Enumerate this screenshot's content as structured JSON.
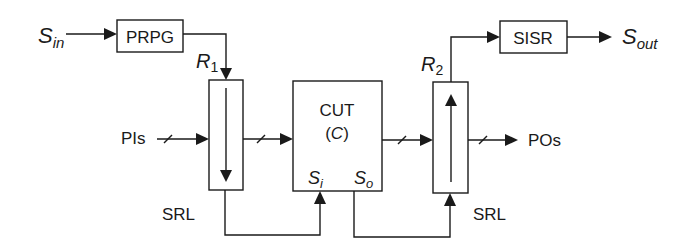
{
  "diagram": {
    "inputs": {
      "scan_in": {
        "main": "S",
        "sub": "in"
      },
      "primary_inputs": "PIs"
    },
    "outputs": {
      "scan_out": {
        "main": "S",
        "sub": "out"
      },
      "primary_outputs": "POs"
    },
    "blocks": {
      "prpg": "PRPG",
      "sisr": "SISR",
      "cut": {
        "line1": "CUT",
        "line2_open": "(",
        "line2_var": "C",
        "line2_close": ")"
      },
      "cut_scan_in": {
        "main": "S",
        "sub": "i"
      },
      "cut_scan_out": {
        "main": "S",
        "sub": "o"
      }
    },
    "registers": {
      "r1": {
        "main": "R",
        "sub": "1",
        "label": "SRL"
      },
      "r2": {
        "main": "R",
        "sub": "2",
        "label": "SRL"
      }
    }
  }
}
